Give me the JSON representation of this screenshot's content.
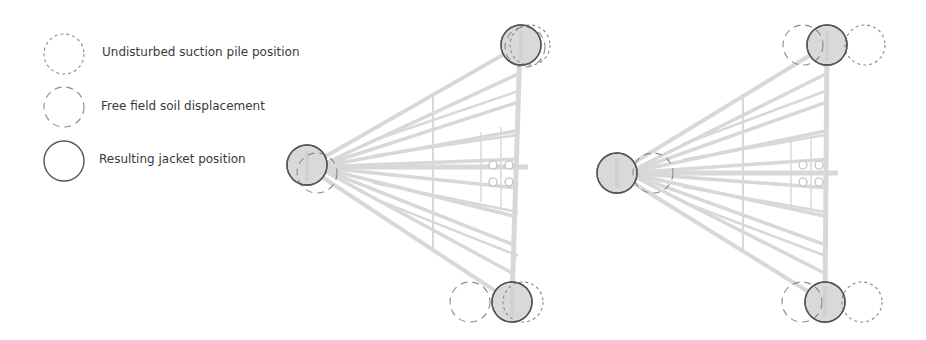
{
  "legend": {
    "items": [
      {
        "label": "Undisturbed suction pile position",
        "style": "short-dash",
        "cx": 64,
        "cy": 54,
        "text_x": 102,
        "text_y": 45
      },
      {
        "label": "Free field soil displacement",
        "style": "long-dash",
        "cx": 64,
        "cy": 107,
        "text_x": 101,
        "text_y": 99
      },
      {
        "label": "Resulting jacket position",
        "style": "solid",
        "cx": 64,
        "cy": 161,
        "text_x": 99,
        "text_y": 152
      }
    ],
    "radius": 20
  },
  "colors": {
    "stroke_solid": "#555555",
    "stroke_dash": "#8a8a8a",
    "pile_fill": "#d9d9d9",
    "structure": "#d4d4d4",
    "text": "#3a3a3a"
  },
  "diagrams": [
    {
      "name": "left-jacket",
      "apex_left": [
        307,
        167
      ],
      "leg_top": [
        520,
        45
      ],
      "leg_bottom": [
        512,
        302
      ],
      "vertical_x": 433,
      "piles": [
        {
          "id": "top",
          "solid": [
            521,
            45
          ],
          "long_dash": [
            525,
            47
          ],
          "short_dash": [
            530,
            45
          ]
        },
        {
          "id": "left",
          "solid": [
            307,
            165
          ],
          "long_dash": [
            317,
            173
          ],
          "short_dash": null
        },
        {
          "id": "bottom",
          "solid": [
            512,
            302
          ],
          "long_dash": [
            470,
            302
          ],
          "short_dash": [
            523,
            302
          ]
        }
      ],
      "bolts": [
        [
          493,
          165
        ],
        [
          509,
          165
        ],
        [
          493,
          182
        ],
        [
          509,
          182
        ]
      ]
    },
    {
      "name": "right-jacket",
      "apex_left": [
        617,
        173
      ],
      "leg_top": [
        827,
        45
      ],
      "leg_bottom": [
        825,
        302
      ],
      "vertical_x": 743,
      "piles": [
        {
          "id": "top",
          "solid": [
            827,
            45
          ],
          "long_dash": [
            803,
            45
          ],
          "short_dash": [
            865,
            45
          ]
        },
        {
          "id": "left",
          "solid": [
            617,
            173
          ],
          "long_dash": [
            653,
            173
          ],
          "short_dash": null
        },
        {
          "id": "bottom",
          "solid": [
            825,
            302
          ],
          "long_dash": [
            802,
            302
          ],
          "short_dash": [
            862,
            302
          ]
        }
      ],
      "bolts": [
        [
          803,
          165
        ],
        [
          819,
          165
        ],
        [
          803,
          182
        ],
        [
          819,
          182
        ]
      ]
    }
  ]
}
